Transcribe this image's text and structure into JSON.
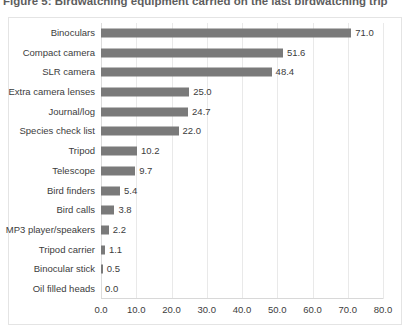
{
  "figure": {
    "caption": "Figure 5:  Birdwatching equipment carried on the last birdwatching trip"
  },
  "chart_data": {
    "type": "bar",
    "orientation": "horizontal",
    "title": "Figure 5:  Birdwatching equipment carried on the last birdwatching trip",
    "xlabel": "",
    "ylabel": "",
    "xlim": [
      0.0,
      80.0
    ],
    "xticks": [
      "0.0",
      "10.0",
      "20.0",
      "30.0",
      "40.0",
      "50.0",
      "60.0",
      "70.0",
      "80.0"
    ],
    "xtick_values": [
      0,
      10,
      20,
      30,
      40,
      50,
      60,
      70,
      80
    ],
    "grid": "vertical",
    "legend": "none",
    "bar_color": "#7a7a7a",
    "categories": [
      "Binoculars",
      "Compact camera",
      "SLR camera",
      "Extra camera lenses",
      "Journal/log",
      "Species check list",
      "Tripod",
      "Telescope",
      "Bird finders",
      "Bird calls",
      "MP3 player/speakers",
      "Tripod carrier",
      "Binocular stick",
      "Oil filled heads"
    ],
    "values": [
      71.0,
      51.6,
      48.4,
      25.0,
      24.7,
      22.0,
      10.2,
      9.7,
      5.4,
      3.8,
      2.2,
      1.1,
      0.5,
      0.0
    ],
    "data_labels": [
      "71.0",
      "51.6",
      "48.4",
      "25.0",
      "24.7",
      "22.0",
      "10.2",
      "9.7",
      "5.4",
      "3.8",
      "2.2",
      "1.1",
      "0.5",
      "0.0"
    ]
  }
}
